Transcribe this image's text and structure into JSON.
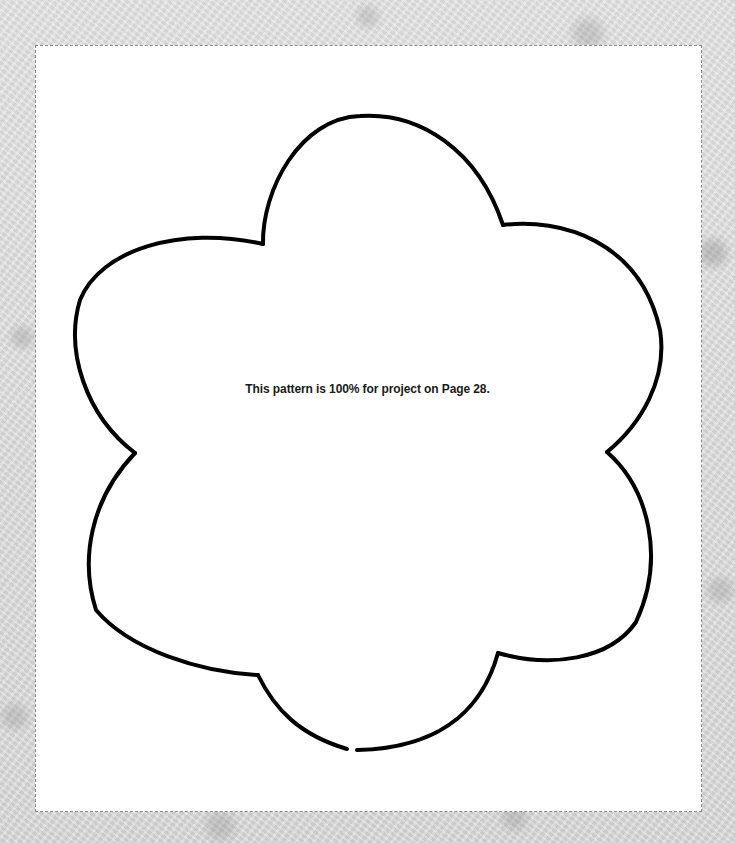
{
  "document": {
    "type": "craft-pattern-template",
    "shape": "six-petal flower",
    "caption": "This pattern is 100% for project on Page 28.",
    "colors": {
      "background": "#dcdcdc",
      "page": "#ffffff",
      "outline": "#000000",
      "cut_line": "#8a8a8a",
      "caption_text": "#1a1a1a"
    }
  }
}
